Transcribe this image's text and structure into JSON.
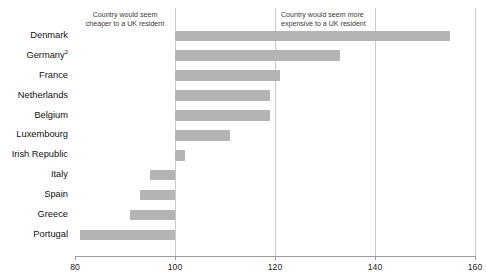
{
  "chart_data": {
    "type": "bar",
    "orientation": "horizontal",
    "title": "",
    "xlabel": "",
    "ylabel": "",
    "xlim": [
      80,
      160
    ],
    "baseline": 100,
    "grid": true,
    "gridlines": [
      100,
      120,
      140,
      160
    ],
    "ticks": [
      80,
      100,
      120,
      140,
      160
    ],
    "tick_labels": [
      "80",
      "100",
      "120",
      "140",
      "160"
    ],
    "bar_color": "#b4b4b4",
    "categories": [
      "Denmark",
      "Germany",
      "France",
      "Netherlands",
      "Belgium",
      "Luxembourg",
      "Irish Republic",
      "Italy",
      "Spain",
      "Greece",
      "Portugal"
    ],
    "category_footnotes": [
      "",
      "2",
      "",
      "",
      "",
      "",
      "",
      "",
      "",
      "",
      ""
    ],
    "values": [
      155,
      133,
      121,
      119,
      119,
      111,
      102,
      95,
      93,
      91,
      81
    ],
    "annotations": [
      {
        "name": "cheaper-note",
        "text": "Country would seem\ncheaper to a UK resident",
        "side": "left"
      },
      {
        "name": "expensive-note",
        "text": "Country would seem more\nexpensive to a UK resident",
        "side": "right"
      }
    ],
    "legend": []
  }
}
